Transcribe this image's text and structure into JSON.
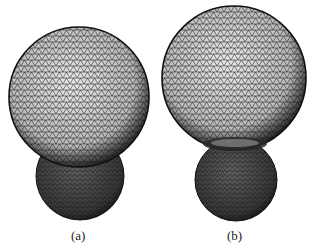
{
  "figure": {
    "panels": [
      {
        "id": "a",
        "caption": "(a)",
        "description": "Wireframe triangulated mesh: large sphere on top of a smaller, darker sphere (overlapping)"
      },
      {
        "id": "b",
        "caption": "(b)",
        "description": "Wireframe triangulated mesh: large sphere on top of a smaller, darker sphere (necked contact)"
      }
    ],
    "colors": {
      "mesh_line": "#111111",
      "background": "#ffffff",
      "small_sphere_fill": "#555555",
      "large_sphere_fill": "#cfcfcf"
    }
  }
}
